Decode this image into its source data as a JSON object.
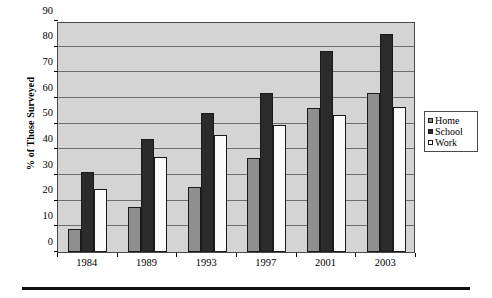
{
  "chart_data": {
    "type": "bar",
    "title": "",
    "xlabel": "",
    "ylabel": "% of Those Surveyed",
    "categories": [
      "1984",
      "1989",
      "1993",
      "1997",
      "2001",
      "2003"
    ],
    "series": [
      {
        "name": "Home",
        "values": [
          9,
          17.5,
          25.5,
          36.5,
          56,
          62
        ],
        "color": "#8f8f8f"
      },
      {
        "name": "School",
        "values": [
          31,
          44,
          54,
          62,
          78.5,
          85
        ],
        "color": "#2b2b2b"
      },
      {
        "name": "Work",
        "values": [
          24.5,
          37,
          45.5,
          49.5,
          53.5,
          56.5
        ],
        "color": "#ffffff"
      }
    ],
    "ylim": [
      0,
      90
    ],
    "ytick_step": 10,
    "ytick_labels": [
      "0",
      "10",
      "20",
      "30",
      "40",
      "50",
      "60",
      "70",
      "80",
      "90"
    ],
    "grid": true,
    "legend_position": "right",
    "plot_background": "#d4d4d4",
    "figure_background": "#ffffff"
  },
  "legend": {
    "items": [
      {
        "label": "Home",
        "marker": "square-gray-swatch"
      },
      {
        "label": "School",
        "marker": "square-black-swatch"
      },
      {
        "label": "Work",
        "marker": "square-white-swatch"
      }
    ]
  },
  "axis": {
    "y_title": "% of Those Surveyed"
  }
}
